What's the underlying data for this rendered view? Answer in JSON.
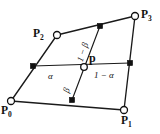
{
  "figure": {
    "background_color": "#ffffff",
    "stroke_color": "#1a1a1a",
    "width": 160,
    "height": 134
  },
  "vertices": [
    {
      "id": "p0",
      "name": "P",
      "subscript": "0",
      "label": "P0",
      "x": 11,
      "y": 101,
      "marker": "open-circle"
    },
    {
      "id": "p1",
      "name": "P",
      "subscript": "1",
      "label": "P1",
      "x": 124,
      "y": 110,
      "marker": "open-circle"
    },
    {
      "id": "p2",
      "name": "P",
      "subscript": "2",
      "label": "P2",
      "x": 57,
      "y": 35,
      "marker": "open-circle"
    },
    {
      "id": "p3",
      "name": "P",
      "subscript": "3",
      "label": "P3",
      "x": 135,
      "y": 16,
      "marker": "open-circle"
    }
  ],
  "interior_point": {
    "id": "p",
    "label": "p",
    "x": 84,
    "y": 67,
    "marker": "open-circle"
  },
  "edge_midpoints": [
    {
      "id": "m-left",
      "x": 33,
      "y": 66,
      "marker": "filled-square",
      "on_edge": "P0-P2"
    },
    {
      "id": "m-right",
      "x": 130,
      "y": 63,
      "marker": "filled-square",
      "on_edge": "P1-P3"
    },
    {
      "id": "m-top",
      "x": 100,
      "y": 26,
      "marker": "filled-square",
      "on_edge": "P2-P3"
    },
    {
      "id": "m-bottom",
      "x": 72,
      "y": 100,
      "marker": "filled-square",
      "on_edge": "P0-P1"
    }
  ],
  "edges": [
    {
      "id": "edge-p0-p2",
      "from": "p0",
      "to": "p2"
    },
    {
      "id": "edge-p2-p3",
      "from": "p2",
      "to": "p3"
    },
    {
      "id": "edge-p3-p1",
      "from": "p3",
      "to": "p1"
    },
    {
      "id": "edge-p1-p0",
      "from": "p1",
      "to": "p0"
    }
  ],
  "parameter_lines": [
    {
      "id": "line-horizontal",
      "description": "horizontal parameter line through p",
      "from": "m-left",
      "to": "m-right"
    },
    {
      "id": "line-vertical",
      "description": "vertical parameter line through p",
      "from": "m-top",
      "to": "m-bottom"
    }
  ],
  "parameter_labels": [
    {
      "id": "alpha",
      "text": "α",
      "x": 48,
      "y": 72,
      "rotation": 0,
      "describes": "fraction from left midpoint to p"
    },
    {
      "id": "one-minus-alpha",
      "text": "1 − α",
      "x": 94,
      "y": 71,
      "rotation": 0,
      "describes": "fraction from p to right midpoint"
    },
    {
      "id": "beta",
      "text": "β",
      "x": 66,
      "y": 88,
      "rotation": -72,
      "describes": "fraction from bottom midpoint to p"
    },
    {
      "id": "one-minus-beta",
      "text": "1 − β",
      "x": 80,
      "y": 57,
      "rotation": -72,
      "describes": "fraction from p to top midpoint"
    }
  ]
}
